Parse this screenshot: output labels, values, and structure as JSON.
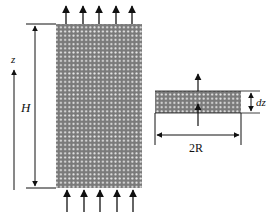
{
  "diagram": {
    "labels": {
      "z_axis": "z",
      "height": "H",
      "slice_thickness": "dz",
      "diameter": "2R"
    },
    "colors": {
      "ink": "#111111",
      "porous_fill": "#7a7a7a",
      "pore_dots": "#e8e8e8"
    },
    "elements": [
      "porous-column",
      "flow-in-arrows",
      "flow-out-arrows",
      "height-dimension",
      "z-axis-arrow",
      "differential-slice",
      "slice-thickness-dimension",
      "diameter-dimension"
    ]
  }
}
